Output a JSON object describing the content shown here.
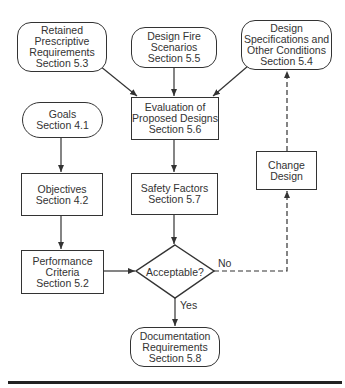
{
  "diagram": {
    "nodes": {
      "retained": {
        "lines": [
          "Retained",
          "Prescriptive",
          "Requirements",
          "Section 5.3"
        ]
      },
      "fire": {
        "lines": [
          "Design Fire",
          "Scenarios",
          "Section 5.5"
        ]
      },
      "specs": {
        "lines": [
          "Design",
          "Specifications and",
          "Other Conditions",
          "Section 5.4"
        ]
      },
      "goals": {
        "lines": [
          "Goals",
          "Section 4.1"
        ]
      },
      "evaluation": {
        "lines": [
          "Evaluation of",
          "Proposed Designs",
          "Section 5.6"
        ]
      },
      "objectives": {
        "lines": [
          "Objectives",
          "Section 4.2"
        ]
      },
      "safety": {
        "lines": [
          "Safety Factors",
          "Section 5.7"
        ]
      },
      "change": {
        "lines": [
          "Change",
          "Design"
        ]
      },
      "performance": {
        "lines": [
          "Performance",
          "Criteria",
          "Section 5.2"
        ]
      },
      "decision": {
        "label": "Acceptable?"
      },
      "documentation": {
        "lines": [
          "Documentation",
          "Requirements",
          "Section 5.8"
        ]
      }
    },
    "edge_labels": {
      "no": "No",
      "yes": "Yes"
    },
    "colors": {
      "stroke": "#333333",
      "background": "#ffffff"
    }
  }
}
